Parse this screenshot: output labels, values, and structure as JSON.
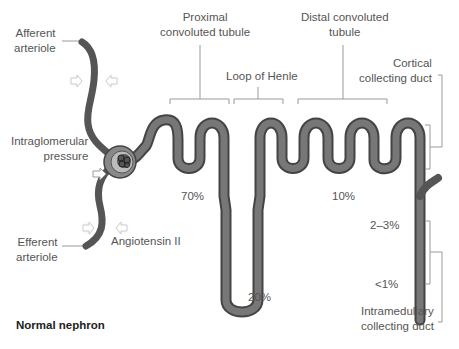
{
  "title": "Normal nephron",
  "labels": {
    "afferent": [
      "Afferent",
      "arteriole"
    ],
    "efferent": [
      "Efferent",
      "arteriole"
    ],
    "intraglomerular": [
      "Intraglomerular",
      "pressure"
    ],
    "angiotensin": "Angiotensin II",
    "proximal": [
      "Proximal",
      "convoluted tubule"
    ],
    "loop": "Loop of Henle",
    "distal": [
      "Distal convoluted",
      "tubule"
    ],
    "cortical": [
      "Cortical",
      "collecting duct"
    ],
    "intramedullary": [
      "Intramedullary",
      "collecting duct"
    ]
  },
  "percentages": {
    "proximal": "70%",
    "loop": "20%",
    "distal": "10%",
    "cortical": "2–3%",
    "intramedullary": "<1%"
  },
  "colors": {
    "tubule": "#666666",
    "tubule_edge": "#444444",
    "capsule": "#999999",
    "bracket": "#888888",
    "arrow_glow": "#dddddd"
  }
}
